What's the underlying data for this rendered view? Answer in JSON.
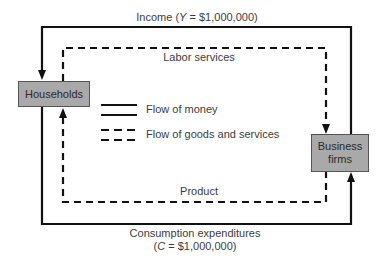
{
  "diagram": {
    "type": "circular-flow",
    "nodes": {
      "households": "Households",
      "business_firms": "Business firms",
      "business_firms_line1": "Business",
      "business_firms_line2": "firms"
    },
    "flows": {
      "income": {
        "label": "Income (Y = $1,000,000)",
        "label_prefix": "Income (",
        "var": "Y",
        "label_suffix": " = $1,000,000)",
        "kind": "money",
        "from": "Business firms",
        "to": "Households"
      },
      "labor": {
        "label": "Labor services",
        "kind": "goods",
        "from": "Households",
        "to": "Business firms"
      },
      "product": {
        "label": "Product",
        "kind": "goods",
        "from": "Business firms",
        "to": "Households"
      },
      "consumption": {
        "label_line1": "Consumption expenditures",
        "label_line2": "(C = $1,000,000)",
        "line2_prefix": "(",
        "var": "C",
        "line2_suffix": " = $1,000,000)",
        "kind": "money",
        "from": "Households",
        "to": "Business firms"
      }
    },
    "legend": {
      "money": "Flow of money",
      "goods": "Flow of goods and services"
    },
    "colors": {
      "line": "#111111",
      "box_fill": "#a9a9a9",
      "text": "#3c3c3c"
    }
  }
}
